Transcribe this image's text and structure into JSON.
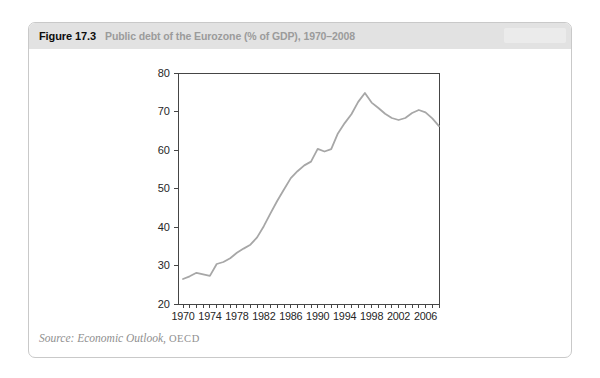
{
  "figure": {
    "label": "Figure 17.3",
    "title": "Public debt of the Eurozone (% of GDP), 1970–2008",
    "source_italic": "Source: Economic Outlook,",
    "source_plain": "OECD"
  },
  "colors": {
    "header_bg": "#e2e2e2",
    "card_border": "#c9c9c9",
    "line": "#a7a7a7",
    "axis": "#454545",
    "tick_label": "#262626",
    "title_gray": "#9b9b9b",
    "source_gray": "#8f8f8f"
  },
  "chart_data": {
    "type": "line",
    "title": "Public debt of the Eurozone (% of GDP), 1970–2008",
    "series_name": "Eurozone public debt (% of GDP)",
    "x": [
      1970,
      1971,
      1972,
      1973,
      1974,
      1975,
      1976,
      1977,
      1978,
      1979,
      1980,
      1981,
      1982,
      1983,
      1984,
      1985,
      1986,
      1987,
      1988,
      1989,
      1990,
      1991,
      1992,
      1993,
      1994,
      1995,
      1996,
      1997,
      1998,
      1999,
      2000,
      2001,
      2002,
      2003,
      2004,
      2005,
      2006,
      2007,
      2008
    ],
    "values": [
      26.5,
      27.2,
      28.1,
      27.7,
      27.3,
      30.4,
      30.9,
      31.9,
      33.3,
      34.4,
      35.4,
      37.3,
      40.2,
      43.6,
      46.8,
      49.8,
      52.7,
      54.5,
      56.0,
      57.0,
      60.3,
      59.6,
      60.2,
      64.3,
      67.0,
      69.3,
      72.5,
      74.8,
      72.3,
      70.9,
      69.4,
      68.3,
      67.8,
      68.3,
      69.6,
      70.4,
      69.8,
      68.2,
      66.2
    ],
    "xlabel": "",
    "ylabel": "",
    "ylim": [
      20,
      80
    ],
    "ytick_step": 10,
    "ytick_labels": [
      "20",
      "30",
      "40",
      "50",
      "60",
      "70",
      "80"
    ],
    "xtick_labels": [
      "1970",
      "1974",
      "1978",
      "1982",
      "1986",
      "1990",
      "1994",
      "1998",
      "2002",
      "2006"
    ],
    "xtick_minor_every_year": true,
    "grid": false,
    "legend": "none",
    "plot_frame": "full-box"
  }
}
